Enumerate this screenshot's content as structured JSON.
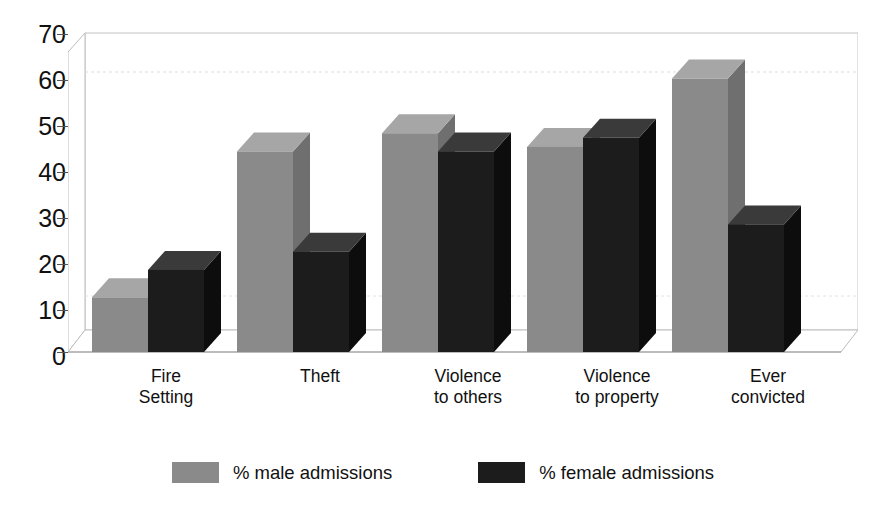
{
  "chart_data": {
    "type": "bar",
    "title": "",
    "xlabel": "",
    "ylabel": "",
    "ylim": [
      0,
      70
    ],
    "ytick_step": 10,
    "yticks": [
      70,
      60,
      50,
      40,
      30,
      20,
      10,
      0
    ],
    "grid": false,
    "style": "3d-clustered-column",
    "legend_position": "bottom-center",
    "categories": [
      "Fire\nSetting",
      "Theft",
      "Violence\nto others",
      "Violence\nto property",
      "Ever\nconvicted"
    ],
    "category_lines": [
      [
        "Fire",
        "Setting"
      ],
      [
        "Theft",
        ""
      ],
      [
        "Violence",
        "to others"
      ],
      [
        "Violence",
        "to property"
      ],
      [
        "Ever",
        "convicted"
      ]
    ],
    "series": [
      {
        "name": "% male admissions",
        "color": "#8a8a8a",
        "values": [
          12,
          44,
          48,
          45,
          60
        ]
      },
      {
        "name": "% female admissions",
        "color": "#1c1c1c",
        "values": [
          18,
          22,
          44,
          47,
          28
        ]
      }
    ]
  },
  "legend": {
    "entries": [
      {
        "label": "% male admissions",
        "swatch": "#8a8a8a"
      },
      {
        "label": "% female admissions",
        "swatch": "#1c1c1c"
      }
    ]
  },
  "axis": {
    "y_labels": [
      "70",
      "60",
      "50",
      "40",
      "30",
      "20",
      "10",
      "0"
    ]
  },
  "colors": {
    "male_face": "#8a8a8a",
    "male_top": "#a6a6a6",
    "male_side": "#6f6f6f",
    "female_face": "#1c1c1c",
    "female_top": "#3a3a3a",
    "female_side": "#0d0d0d",
    "frame_line": "#b9b9b9",
    "axis_line": "#555555",
    "text": "#111111",
    "background": "#ffffff"
  }
}
